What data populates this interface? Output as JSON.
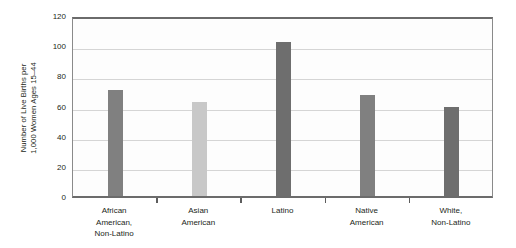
{
  "chart_data": {
    "type": "bar",
    "title": "",
    "xlabel": "",
    "ylabel": "Number of Live Births per 1,000 Women Ages 15–44",
    "ylabel_line1": "Number of Live Births per",
    "ylabel_line2": "1,000 Women Ages 15–44",
    "categories": [
      "African American, Non-Latino",
      "Asian American",
      "Latino",
      "Native American",
      "White, Non-Latino"
    ],
    "category_lines": [
      [
        "African",
        "American,",
        "Non-Latino"
      ],
      [
        "Asian",
        "American"
      ],
      [
        "Latino"
      ],
      [
        "Native",
        "American"
      ],
      [
        "White,",
        "Non-Latino"
      ]
    ],
    "values": [
      70,
      62,
      102,
      67,
      59
    ],
    "bar_colors": [
      "#808080",
      "#c8c8c8",
      "#6e6e6e",
      "#808080",
      "#6e6e6e"
    ],
    "ylim": [
      0,
      120
    ],
    "yticks": [
      0,
      20,
      40,
      60,
      80,
      100,
      120
    ],
    "ytick_labels": [
      "0",
      "20",
      "40",
      "60",
      "80",
      "100",
      "120"
    ],
    "grid": true,
    "legend": "none"
  }
}
